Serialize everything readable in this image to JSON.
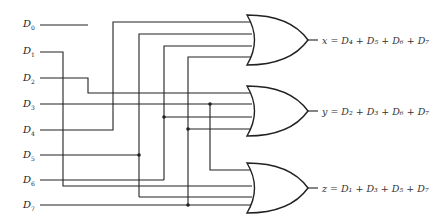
{
  "diagram": {
    "title": "",
    "type": "8-to-3 encoder (OR gate implementation)",
    "inputs": [
      {
        "name": "D",
        "sub": "0"
      },
      {
        "name": "D",
        "sub": "1"
      },
      {
        "name": "D",
        "sub": "2"
      },
      {
        "name": "D",
        "sub": "3"
      },
      {
        "name": "D",
        "sub": "4"
      },
      {
        "name": "D",
        "sub": "5"
      },
      {
        "name": "D",
        "sub": "6"
      },
      {
        "name": "D",
        "sub": "7"
      }
    ],
    "outputs": [
      {
        "gate": "OR",
        "label": "x = D₄ + D₅ + D₆ + D₇",
        "inputs": [
          "D4",
          "D5",
          "D6",
          "D7"
        ]
      },
      {
        "gate": "OR",
        "label": "y = D₂ + D₃ + D₆ + D₇",
        "inputs": [
          "D2",
          "D3",
          "D6",
          "D7"
        ]
      },
      {
        "gate": "OR",
        "label": "z = D₁ + D₃ + D₅ + D₇",
        "inputs": [
          "D1",
          "D3",
          "D5",
          "D7"
        ]
      }
    ],
    "colors": {
      "line": "#222222",
      "background": "#ffffff"
    }
  }
}
